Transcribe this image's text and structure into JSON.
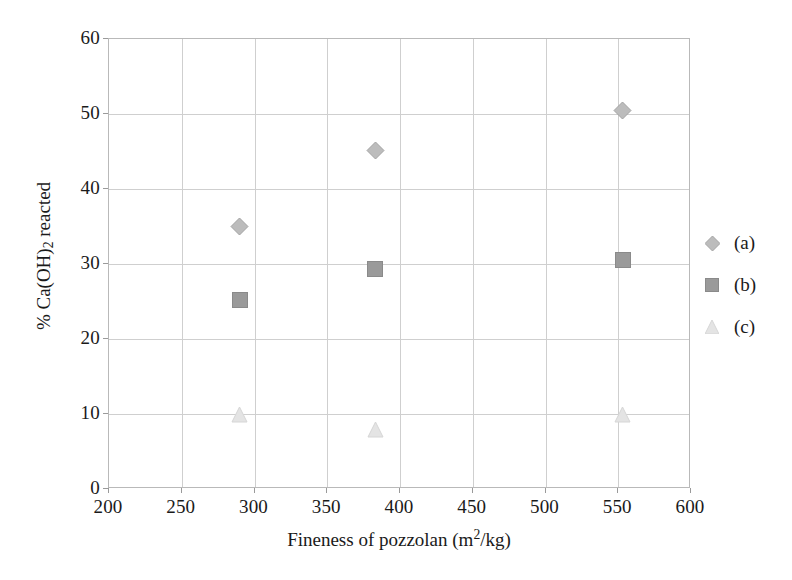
{
  "chart_data": {
    "type": "scatter",
    "title": "",
    "xlabel": "Fineness of pozzolan (m2/kg)",
    "xlabel_parts": {
      "text": "Fineness of pozzolan (m",
      "sup": "2",
      "tail": "/kg)"
    },
    "ylabel": "% Ca(OH)2 reacted",
    "ylabel_parts": {
      "head": "% Ca(OH)",
      "sub": "2",
      "tail": " reacted"
    },
    "xlim": [
      200,
      600
    ],
    "ylim": [
      0,
      60
    ],
    "xticks": [
      200,
      250,
      300,
      350,
      400,
      450,
      500,
      550,
      600
    ],
    "yticks": [
      0,
      10,
      20,
      30,
      40,
      50,
      60
    ],
    "grid": true,
    "legend_position": "right",
    "series": [
      {
        "name": "(a)",
        "marker": "diamond",
        "color": "#bcbcbc",
        "edge": "#a3a3a3",
        "points": [
          {
            "x": 290,
            "y": 35.0
          },
          {
            "x": 383,
            "y": 45.2
          },
          {
            "x": 553,
            "y": 50.5
          }
        ]
      },
      {
        "name": "(b)",
        "marker": "square",
        "color": "#9a9a9a",
        "edge": "#8a8a8a",
        "points": [
          {
            "x": 290,
            "y": 25.2
          },
          {
            "x": 383,
            "y": 29.3
          },
          {
            "x": 553,
            "y": 30.5
          }
        ]
      },
      {
        "name": "(c)",
        "marker": "triangle",
        "color": "#e4e4e4",
        "edge": "#d6d6d6",
        "points": [
          {
            "x": 290,
            "y": 10.0
          },
          {
            "x": 383,
            "y": 8.0
          },
          {
            "x": 553,
            "y": 10.0
          }
        ]
      }
    ]
  },
  "legend": {
    "entries": [
      {
        "label": "(a)"
      },
      {
        "label": "(b)"
      },
      {
        "label": "(c)"
      }
    ]
  }
}
